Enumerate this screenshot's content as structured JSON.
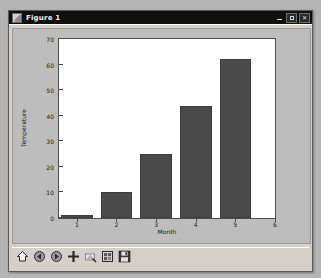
{
  "window": {
    "title": "Figure 1",
    "icon": "figure-icon",
    "controls": [
      {
        "name": "minimize-button",
        "glyph": "–"
      },
      {
        "name": "maximize-button",
        "glyph": "□"
      },
      {
        "name": "close-button",
        "glyph": "✕"
      }
    ]
  },
  "toolbar": {
    "buttons": [
      {
        "name": "home-button",
        "icon": "home-icon",
        "tooltip": "Home"
      },
      {
        "name": "back-button",
        "icon": "back-arrow-icon",
        "tooltip": "Back"
      },
      {
        "name": "forward-button",
        "icon": "forward-arrow-icon",
        "tooltip": "Forward"
      },
      {
        "name": "pan-button",
        "icon": "move-cross-icon",
        "tooltip": "Pan"
      },
      {
        "name": "zoom-button",
        "icon": "zoom-rect-icon",
        "tooltip": "Zoom to rectangle"
      },
      {
        "name": "configure-subplots-button",
        "icon": "subplots-icon",
        "tooltip": "Configure subplots"
      },
      {
        "name": "save-button",
        "icon": "floppy-disk-icon",
        "tooltip": "Save the figure"
      }
    ]
  },
  "colors": {
    "bar": "#4a4a4a",
    "bar_edge": "#3c3c3c",
    "figure_background": "#bdbdbd",
    "axes_background": "#ffffff",
    "axes_edge": "#4d4d4d",
    "titlebar": "#101010",
    "window_face": "#d4d0c8"
  },
  "chart_data": {
    "type": "bar",
    "title": "",
    "xlabel": "Month",
    "ylabel": "Temperature",
    "categories": [
      1,
      2,
      3,
      4,
      5
    ],
    "values": [
      1,
      10,
      25,
      44,
      62
    ],
    "xlim": [
      0.55,
      6.0
    ],
    "ylim": [
      0,
      70
    ],
    "xticks": [
      1,
      2,
      3,
      4,
      5,
      6
    ],
    "yticks": [
      0,
      10,
      20,
      30,
      40,
      50,
      60,
      70
    ],
    "grid": false,
    "legend": null,
    "bar_width": 0.8,
    "bar_color": "#4a4a4a"
  }
}
